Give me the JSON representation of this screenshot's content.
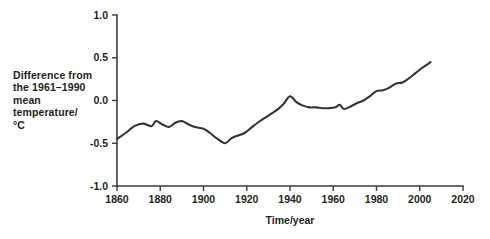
{
  "chart_data": {
    "type": "line",
    "title": "",
    "xlabel": "Time/year",
    "ylabel": "Difference from the 1961–1990 mean temperature/ °C",
    "ylabel_lines": [
      "Difference from",
      "the 1961–1990",
      "mean",
      "temperature/",
      "°C"
    ],
    "xlim": [
      1860,
      2020
    ],
    "ylim": [
      -1.0,
      1.0
    ],
    "xticks": [
      1860,
      1880,
      1900,
      1920,
      1940,
      1960,
      1980,
      2000,
      2020
    ],
    "xtick_labels": [
      "1860",
      "1880",
      "1900",
      "1920",
      "1940",
      "1960",
      "1980",
      "2000",
      "2020"
    ],
    "yticks": [
      -1.0,
      -0.5,
      0.0,
      0.5,
      1.0
    ],
    "ytick_labels": [
      "-1.0",
      "-0.5",
      "0.0",
      "0.5",
      "1.0"
    ],
    "grid": false,
    "legend": false,
    "line_color": "#333334",
    "axis_color": "#3b3b3c",
    "series": [
      {
        "name": "Global mean temperature anomaly",
        "x": [
          1860,
          1864,
          1868,
          1872,
          1876,
          1878,
          1881,
          1884,
          1887,
          1890,
          1893,
          1896,
          1900,
          1903,
          1906,
          1910,
          1913,
          1916,
          1919,
          1922,
          1925,
          1928,
          1931,
          1934,
          1937,
          1940,
          1943,
          1946,
          1949,
          1952,
          1955,
          1958,
          1961,
          1963,
          1965,
          1968,
          1971,
          1974,
          1977,
          1980,
          1983,
          1986,
          1989,
          1992,
          1995,
          1998,
          2001,
          2005
        ],
        "y": [
          -0.45,
          -0.38,
          -0.3,
          -0.27,
          -0.3,
          -0.24,
          -0.28,
          -0.31,
          -0.26,
          -0.24,
          -0.28,
          -0.31,
          -0.33,
          -0.38,
          -0.44,
          -0.5,
          -0.44,
          -0.41,
          -0.38,
          -0.32,
          -0.26,
          -0.21,
          -0.16,
          -0.11,
          -0.04,
          0.05,
          -0.02,
          -0.06,
          -0.08,
          -0.08,
          -0.09,
          -0.09,
          -0.08,
          -0.05,
          -0.1,
          -0.07,
          -0.03,
          0.0,
          0.05,
          0.11,
          0.12,
          0.15,
          0.2,
          0.21,
          0.26,
          0.32,
          0.38,
          0.45
        ]
      }
    ]
  },
  "axes": {
    "x_title": "Time/year"
  }
}
